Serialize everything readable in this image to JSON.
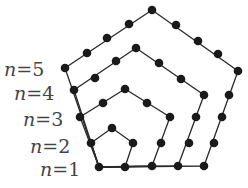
{
  "labels": [
    {
      "text": "n = 5",
      "var": "n",
      "eq": "=5",
      "x": 4,
      "y": 76
    },
    {
      "text": "n = 4",
      "var": "n",
      "eq": "=4",
      "x": 14,
      "y": 100
    },
    {
      "text": "n = 3",
      "var": "n",
      "eq": "=3",
      "x": 23,
      "y": 126
    },
    {
      "text": "n = 2",
      "var": "n",
      "eq": "=2",
      "x": 30,
      "y": 153
    },
    {
      "text": "n = 1",
      "var": "n",
      "eq": "=1",
      "x": 40,
      "y": 176
    }
  ],
  "pentagons": [
    {
      "n": 2,
      "points": [
        [
          99,
          167
        ],
        [
          125,
          167
        ],
        [
          133,
          143
        ],
        [
          112,
          128
        ],
        [
          91,
          143
        ]
      ]
    },
    {
      "n": 3,
      "points": [
        [
          99,
          167
        ],
        [
          152,
          166
        ],
        [
          170,
          117
        ],
        [
          125,
          89
        ],
        [
          80,
          117
        ]
      ]
    },
    {
      "n": 4,
      "points": [
        [
          99,
          167
        ],
        [
          178,
          166
        ],
        [
          204,
          95
        ],
        [
          136,
          48
        ],
        [
          74,
          90
        ]
      ]
    },
    {
      "n": 5,
      "points": [
        [
          99,
          167
        ],
        [
          204,
          166
        ],
        [
          238,
          71
        ],
        [
          152,
          10
        ],
        [
          65,
          68
        ]
      ]
    }
  ],
  "dots": [
    [
      99,
      167
    ],
    [
      125,
      167
    ],
    [
      152,
      166
    ],
    [
      178,
      166
    ],
    [
      204,
      166
    ],
    [
      91,
      143
    ],
    [
      80,
      117
    ],
    [
      74,
      90
    ],
    [
      65,
      68
    ],
    [
      133,
      143
    ],
    [
      112,
      128
    ],
    [
      161,
      143
    ],
    [
      170,
      117
    ],
    [
      147,
      103
    ],
    [
      125,
      89
    ],
    [
      103,
      103
    ],
    [
      189,
      143
    ],
    [
      196,
      117
    ],
    [
      204,
      95
    ],
    [
      181,
      79
    ],
    [
      159,
      63
    ],
    [
      136,
      48
    ],
    [
      116,
      61
    ],
    [
      95,
      78
    ],
    [
      214,
      143
    ],
    [
      222,
      117
    ],
    [
      229,
      95
    ],
    [
      238,
      71
    ],
    [
      218,
      54
    ],
    [
      198,
      41
    ],
    [
      176,
      25
    ],
    [
      152,
      10
    ],
    [
      129,
      24
    ],
    [
      107,
      38
    ],
    [
      87,
      53
    ]
  ]
}
